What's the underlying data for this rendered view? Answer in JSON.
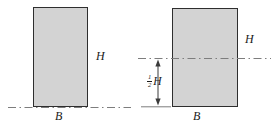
{
  "colors": {
    "background": "#ffffff",
    "fill": "#d3d3d3",
    "border": "#2e2e2e",
    "line": "#7d7d7d",
    "dim": "#3a3a3a",
    "text": "#1a1a1a"
  },
  "left_figure": {
    "height_label": "H",
    "width_label": "B"
  },
  "right_figure": {
    "height_label": "H",
    "width_label": "B",
    "dimension": {
      "numerator": "1",
      "denominator": "2",
      "variable": "H"
    }
  }
}
